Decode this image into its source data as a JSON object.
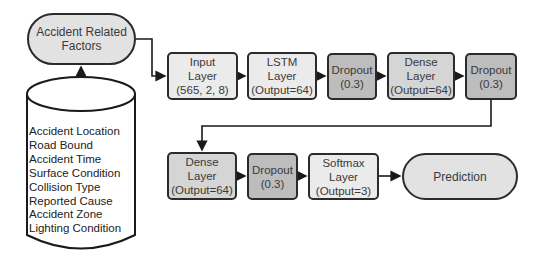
{
  "diagram": {
    "source_node": {
      "label_line1": "Accident Related",
      "label_line2": "Factors"
    },
    "database": {
      "factors": [
        "Accident Location",
        "Road Bound",
        "Accident Time",
        "Surface Condition",
        "Collision Type",
        "Reported Cause",
        "Accident Zone",
        "Lighting Condition"
      ]
    },
    "row1": [
      {
        "id": "input",
        "line1": "Input",
        "line2": "Layer",
        "line3": "(565, 2, 8)"
      },
      {
        "id": "lstm",
        "line1": "LSTM",
        "line2": "Layer",
        "line3": "(Output=64)"
      },
      {
        "id": "dropout1",
        "line1": "Dropout",
        "line2": "(0.3)"
      },
      {
        "id": "dense1",
        "line1": "Dense",
        "line2": "Layer",
        "line3": "(Output=64)"
      },
      {
        "id": "dropout2",
        "line1": "Dropout",
        "line2": "(0.3)"
      }
    ],
    "row2": [
      {
        "id": "dense2",
        "line1": "Dense",
        "line2": "Layer",
        "line3": "(Output=64)"
      },
      {
        "id": "dropout3",
        "line1": "Dropout",
        "line2": "(0.3)"
      },
      {
        "id": "softmax",
        "line1": "Softmax",
        "line2": "Layer",
        "line3": "(Output=3)"
      }
    ],
    "output_node": {
      "label": "Prediction"
    },
    "colors": {
      "stroke": "#2b2b2b",
      "light_fill": "#ebebeb",
      "dense_fill": "#d5d5d5",
      "dropout_fill": "#bdbdbd",
      "pill_fill": "#e2e2e2"
    }
  }
}
